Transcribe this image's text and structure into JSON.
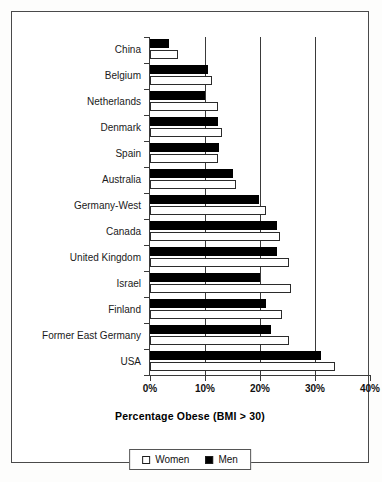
{
  "chart_data": {
    "type": "bar",
    "orientation": "horizontal",
    "title": "",
    "xlabel": "Percentage Obese (BMI > 30)",
    "ylabel": "",
    "xlim": [
      0,
      40
    ],
    "xticks": [
      0,
      10,
      20,
      30,
      40
    ],
    "xticklabels": [
      "0%",
      "10%",
      "20%",
      "30%",
      "40%"
    ],
    "grid": "vertical gridlines at 10%, 20%, 30%",
    "legend_position": "bottom-center",
    "categories": [
      "China",
      "Belgium",
      "Netherlands",
      "Denmark",
      "Spain",
      "Australia",
      "Germany-West",
      "Canada",
      "United Kingdom",
      "Israel",
      "Finland",
      "Former East Germany",
      "USA"
    ],
    "series": [
      {
        "name": "Men",
        "color": "#000000",
        "values": [
          3.4,
          10.5,
          10.0,
          12.3,
          12.5,
          15.0,
          19.8,
          23.0,
          23.0,
          20.0,
          21.0,
          22.0,
          31.1
        ]
      },
      {
        "name": "Women",
        "color": "#ffffff",
        "values": [
          5.1,
          11.3,
          12.3,
          13.0,
          12.3,
          15.7,
          21.0,
          23.6,
          25.3,
          25.7,
          24.0,
          25.3,
          33.6
        ]
      }
    ]
  },
  "legend": {
    "entries": [
      {
        "label": "Women",
        "swatch": "white-square"
      },
      {
        "label": "Men",
        "swatch": "black-square"
      }
    ]
  }
}
